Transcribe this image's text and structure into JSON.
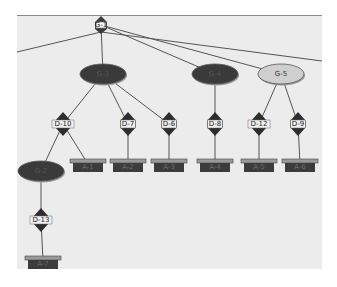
{
  "diagram": {
    "type": "tree",
    "background": "#ececec",
    "colors": {
      "dark_node": "#3a3a3a",
      "light_node": "#cfcfcf",
      "edge": "#555555",
      "leaf": "#3c3c3c",
      "leaf_cap": "#9a9a9a"
    },
    "root": {
      "id": "root",
      "label": "G-1",
      "x": 101,
      "y": 25
    },
    "goal_nodes": [
      {
        "id": "g3",
        "label": "G-3",
        "x": 103,
        "y": 74,
        "style": "dark"
      },
      {
        "id": "g4",
        "label": "G-4",
        "x": 215,
        "y": 74,
        "style": "dark"
      },
      {
        "id": "g5",
        "label": "G-5",
        "x": 281,
        "y": 74,
        "style": "light"
      },
      {
        "id": "g2",
        "label": "G-2",
        "x": 41,
        "y": 171,
        "style": "dark"
      }
    ],
    "decision_nodes": [
      {
        "id": "d10",
        "label": "D-10",
        "x": 63,
        "y": 124
      },
      {
        "id": "d7",
        "label": "D-7",
        "x": 128,
        "y": 124
      },
      {
        "id": "d6",
        "label": "D-6",
        "x": 169,
        "y": 124
      },
      {
        "id": "d8",
        "label": "D-8",
        "x": 215,
        "y": 124
      },
      {
        "id": "d12",
        "label": "D-12",
        "x": 259,
        "y": 124
      },
      {
        "id": "d9",
        "label": "D-9",
        "x": 298,
        "y": 124
      },
      {
        "id": "d13",
        "label": "D-13",
        "x": 41,
        "y": 220
      }
    ],
    "leaf_nodes": [
      {
        "id": "l1",
        "label": "A-1",
        "x": 88,
        "y": 164
      },
      {
        "id": "l2",
        "label": "A-2",
        "x": 128,
        "y": 164
      },
      {
        "id": "l3",
        "label": "A-3",
        "x": 169,
        "y": 164
      },
      {
        "id": "l4",
        "label": "A-4",
        "x": 215,
        "y": 164
      },
      {
        "id": "l5",
        "label": "A-5",
        "x": 259,
        "y": 164
      },
      {
        "id": "l6",
        "label": "A-6",
        "x": 300,
        "y": 164
      },
      {
        "id": "l7",
        "label": "A-7",
        "x": 43,
        "y": 261
      }
    ],
    "edges": [
      [
        "root",
        "g3"
      ],
      [
        "root",
        "g4"
      ],
      [
        "root",
        "g5"
      ],
      [
        "g3",
        "d10"
      ],
      [
        "g3",
        "d7"
      ],
      [
        "g3",
        "d6"
      ],
      [
        "g4",
        "d8"
      ],
      [
        "g5",
        "d12"
      ],
      [
        "g5",
        "d9"
      ],
      [
        "d10",
        "g2"
      ],
      [
        "d10",
        "l1"
      ],
      [
        "d7",
        "l2"
      ],
      [
        "d6",
        "l3"
      ],
      [
        "d8",
        "l4"
      ],
      [
        "d12",
        "l5"
      ],
      [
        "d9",
        "l6"
      ],
      [
        "g2",
        "d13"
      ],
      [
        "d13",
        "l7"
      ]
    ],
    "offpage_edges": [
      {
        "from": "root",
        "to_x": 17,
        "to_y": 52
      },
      {
        "from": "root",
        "to_x": 322,
        "to_y": 61
      }
    ]
  }
}
